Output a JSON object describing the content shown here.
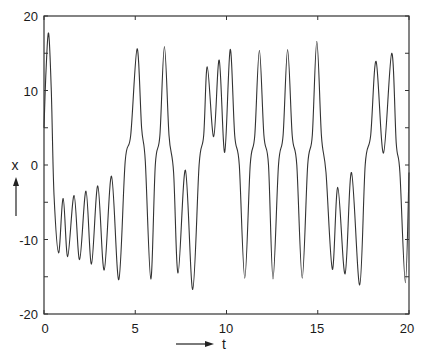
{
  "chart_data": {
    "type": "line",
    "title": "",
    "xlabel": "t",
    "ylabel": "x",
    "xlim": [
      0,
      20
    ],
    "ylim": [
      -20,
      20
    ],
    "x_ticks": [
      0,
      5,
      10,
      15,
      20
    ],
    "y_ticks": [
      -20,
      -10,
      0,
      10,
      20
    ],
    "y_minor_ticks": [
      -15,
      -5,
      5,
      15
    ],
    "grid": false,
    "legend": null,
    "series": [
      {
        "name": "x(t)",
        "color": "#333333",
        "points": [
          [
            0.0,
            5.0
          ],
          [
            0.1,
            12.0
          ],
          [
            0.25,
            17.7
          ],
          [
            0.4,
            10.0
          ],
          [
            0.55,
            -4.0
          ],
          [
            0.8,
            -11.8
          ],
          [
            1.05,
            -4.5
          ],
          [
            1.3,
            -12.3
          ],
          [
            1.65,
            -4.1
          ],
          [
            1.95,
            -12.7
          ],
          [
            2.3,
            -3.5
          ],
          [
            2.6,
            -13.3
          ],
          [
            2.95,
            -2.8
          ],
          [
            3.3,
            -14.1
          ],
          [
            3.7,
            -1.5
          ],
          [
            4.1,
            -15.4
          ],
          [
            4.45,
            0.5
          ],
          [
            4.75,
            4.0
          ],
          [
            5.1,
            15.6
          ],
          [
            5.35,
            5.0
          ],
          [
            5.55,
            0.5
          ],
          [
            5.85,
            -15.3
          ],
          [
            6.1,
            0.0
          ],
          [
            6.35,
            4.0
          ],
          [
            6.6,
            15.9
          ],
          [
            6.85,
            4.0
          ],
          [
            7.1,
            -1.0
          ],
          [
            7.35,
            -14.5
          ],
          [
            7.75,
            -0.7
          ],
          [
            8.15,
            -16.7
          ],
          [
            8.5,
            0.0
          ],
          [
            8.75,
            4.0
          ],
          [
            8.95,
            13.2
          ],
          [
            9.3,
            3.8
          ],
          [
            9.6,
            14.1
          ],
          [
            9.9,
            1.7
          ],
          [
            10.2,
            15.5
          ],
          [
            10.45,
            4.0
          ],
          [
            10.7,
            0.0
          ],
          [
            11.0,
            -15.2
          ],
          [
            11.3,
            0.0
          ],
          [
            11.55,
            4.0
          ],
          [
            11.8,
            15.4
          ],
          [
            12.05,
            4.0
          ],
          [
            12.3,
            0.0
          ],
          [
            12.55,
            -15.3
          ],
          [
            12.85,
            0.0
          ],
          [
            13.1,
            4.0
          ],
          [
            13.35,
            15.5
          ],
          [
            13.6,
            4.0
          ],
          [
            13.85,
            0.0
          ],
          [
            14.15,
            -15.2
          ],
          [
            14.45,
            0.0
          ],
          [
            14.7,
            4.0
          ],
          [
            14.95,
            16.6
          ],
          [
            15.2,
            4.0
          ],
          [
            15.45,
            -1.0
          ],
          [
            15.8,
            -14.0
          ],
          [
            16.1,
            -3.0
          ],
          [
            16.5,
            -14.6
          ],
          [
            16.85,
            -1.0
          ],
          [
            17.3,
            -16.1
          ],
          [
            17.6,
            0.0
          ],
          [
            17.9,
            4.0
          ],
          [
            18.2,
            13.9
          ],
          [
            18.6,
            1.6
          ],
          [
            19.05,
            15.0
          ],
          [
            19.3,
            3.0
          ],
          [
            19.5,
            -1.0
          ],
          [
            19.8,
            -15.8
          ],
          [
            20.0,
            -1.0
          ]
        ]
      }
    ],
    "annotations": [
      {
        "text": "x",
        "arrow": "up",
        "position": "left of y-axis near 0"
      },
      {
        "text": "t",
        "arrow": "right",
        "position": "below x-axis"
      }
    ]
  },
  "labels": {
    "x_axis": "t",
    "y_axis": "x",
    "x_ticks": [
      "0",
      "5",
      "10",
      "15",
      "20"
    ],
    "y_ticks": [
      "20",
      "10",
      "0",
      "-10",
      "-20"
    ]
  }
}
